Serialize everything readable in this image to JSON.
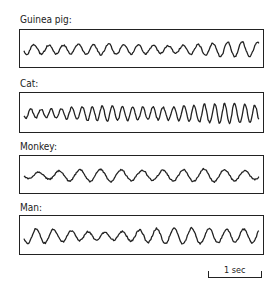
{
  "figure": {
    "panels": [
      {
        "label": "Guinea pig:",
        "top": 29,
        "height": 39,
        "label_top": 14,
        "freq": 0.42,
        "amp": 5.5,
        "seed": 3
      },
      {
        "label": "Cat:",
        "top": 92,
        "height": 41,
        "label_top": 78,
        "freq": 0.62,
        "amp": 7,
        "seed": 7
      },
      {
        "label": "Monkey:",
        "top": 155,
        "height": 39,
        "label_top": 141,
        "freq": 0.3,
        "amp": 5,
        "seed": 11
      },
      {
        "label": "Man:",
        "top": 215,
        "height": 40,
        "label_top": 202,
        "freq": 0.36,
        "amp": 6.5,
        "seed": 5
      }
    ],
    "scale_bar": {
      "label": "1 sec"
    }
  },
  "colors": {
    "ink": "#222222",
    "background": "#ffffff"
  }
}
